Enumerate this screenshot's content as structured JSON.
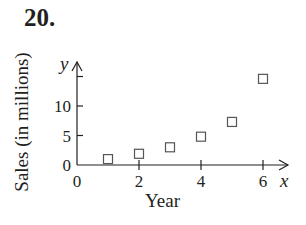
{
  "problem": {
    "number": "20."
  },
  "chart_data": {
    "type": "scatter",
    "title": "",
    "xlabel": "Year",
    "ylabel": "Sales (in millions)",
    "x_var": "x",
    "y_var": "y",
    "x_ticks": [
      0,
      2,
      4,
      6
    ],
    "y_ticks": [
      0,
      5,
      10
    ],
    "y_unlabeled_ticks": [
      15
    ],
    "xlim": [
      0,
      6.9
    ],
    "ylim": [
      0,
      17
    ],
    "grid": false,
    "legend": null,
    "marker": "open-square",
    "series": [
      {
        "name": "Sales",
        "x": [
          1,
          2,
          3,
          4,
          5,
          6
        ],
        "y": [
          1.0,
          1.9,
          3.0,
          4.8,
          7.3,
          14.6
        ]
      }
    ]
  }
}
